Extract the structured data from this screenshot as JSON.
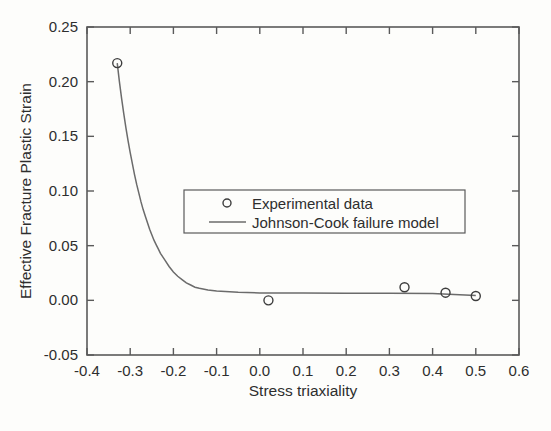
{
  "chart_data": {
    "type": "scatter",
    "title": "",
    "xlabel": "Stress triaxiality",
    "ylabel": "Effective Fracture Plastic Strain",
    "xlim": [
      -0.4,
      0.6
    ],
    "ylim": [
      -0.05,
      0.25
    ],
    "grid": false,
    "legend_position": "center",
    "xticks": [
      "-0.4",
      "-0.3",
      "-0.2",
      "-0.1",
      "0.0",
      "0.1",
      "0.2",
      "0.3",
      "0.4",
      "0.5",
      "0.6"
    ],
    "xtick_values": [
      -0.4,
      -0.3,
      -0.2,
      -0.1,
      0.0,
      0.1,
      0.2,
      0.3,
      0.4,
      0.5,
      0.6
    ],
    "yticks": [
      "-0.05",
      "0.00",
      "0.05",
      "0.10",
      "0.15",
      "0.20",
      "0.25"
    ],
    "ytick_values": [
      -0.05,
      0.0,
      0.05,
      0.1,
      0.15,
      0.2,
      0.25
    ],
    "series": [
      {
        "name": "Experimental data",
        "type": "scatter",
        "marker": "open-circle",
        "color": "#3d3d3d",
        "points": [
          {
            "x": -0.33,
            "y": 0.217
          },
          {
            "x": 0.02,
            "y": 0.0
          },
          {
            "x": 0.335,
            "y": 0.012
          },
          {
            "x": 0.43,
            "y": 0.007
          },
          {
            "x": 0.5,
            "y": 0.004
          }
        ]
      },
      {
        "name": "Johnson-Cook failure model",
        "type": "line",
        "color": "#6b6b6b",
        "points": [
          {
            "x": -0.33,
            "y": 0.217
          },
          {
            "x": -0.325,
            "y": 0.2
          },
          {
            "x": -0.32,
            "y": 0.185
          },
          {
            "x": -0.315,
            "y": 0.171
          },
          {
            "x": -0.31,
            "y": 0.158
          },
          {
            "x": -0.305,
            "y": 0.146
          },
          {
            "x": -0.3,
            "y": 0.135
          },
          {
            "x": -0.295,
            "y": 0.125
          },
          {
            "x": -0.29,
            "y": 0.115
          },
          {
            "x": -0.285,
            "y": 0.106
          },
          {
            "x": -0.28,
            "y": 0.098
          },
          {
            "x": -0.275,
            "y": 0.09
          },
          {
            "x": -0.27,
            "y": 0.083
          },
          {
            "x": -0.265,
            "y": 0.077
          },
          {
            "x": -0.26,
            "y": 0.071
          },
          {
            "x": -0.255,
            "y": 0.065
          },
          {
            "x": -0.25,
            "y": 0.06
          },
          {
            "x": -0.245,
            "y": 0.055
          },
          {
            "x": -0.24,
            "y": 0.051
          },
          {
            "x": -0.235,
            "y": 0.047
          },
          {
            "x": -0.23,
            "y": 0.043
          },
          {
            "x": -0.225,
            "y": 0.04
          },
          {
            "x": -0.22,
            "y": 0.037
          },
          {
            "x": -0.21,
            "y": 0.031
          },
          {
            "x": -0.2,
            "y": 0.026
          },
          {
            "x": -0.19,
            "y": 0.022
          },
          {
            "x": -0.18,
            "y": 0.019
          },
          {
            "x": -0.17,
            "y": 0.016
          },
          {
            "x": -0.16,
            "y": 0.014
          },
          {
            "x": -0.15,
            "y": 0.012
          },
          {
            "x": -0.14,
            "y": 0.011
          },
          {
            "x": -0.12,
            "y": 0.0095
          },
          {
            "x": -0.1,
            "y": 0.0085
          },
          {
            "x": -0.05,
            "y": 0.0073
          },
          {
            "x": 0.0,
            "y": 0.0068
          },
          {
            "x": 0.1,
            "y": 0.0066
          },
          {
            "x": 0.2,
            "y": 0.0065
          },
          {
            "x": 0.3,
            "y": 0.0064
          },
          {
            "x": 0.4,
            "y": 0.0062
          },
          {
            "x": 0.5,
            "y": 0.0045
          }
        ]
      }
    ],
    "legend": [
      {
        "label": "Experimental data",
        "marker": "open-circle"
      },
      {
        "label": "Johnson-Cook failure model",
        "marker": "line"
      }
    ]
  }
}
